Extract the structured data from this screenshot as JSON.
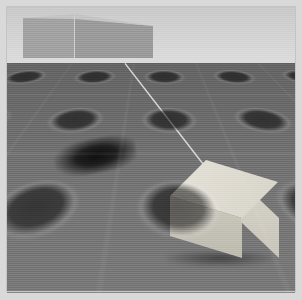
{
  "scene": {
    "title": "3D Rendered Outdoor Scene",
    "description": "Synthetic render of a perspective ground plane with recessed square tiles, a light cuboid object in the foreground, a dark patch on the ground, a distant building on the horizon, and a thin light line descending from the horizon to the foreground box.",
    "render_style": "photorealistic-synthetic",
    "frame": {
      "width_px": 302,
      "height_px": 300,
      "mat_color": "#d9d9d9",
      "mat_border_px": 7
    },
    "camera": {
      "horizon_y_px": 63,
      "view": "low-angle perspective"
    },
    "colors": {
      "sky_top": "#c9c9c9",
      "sky_bottom": "#dcdcdc",
      "ground_near": "#787878",
      "ground_far": "#5f5f5f",
      "building_left_face": "#a2a2a2",
      "building_right_face": "#9a9a9a",
      "building_top_face": "#c4c4c4",
      "box_top_face": "#e0ddd3",
      "box_front_face": "#c4c1b6",
      "box_side_face": "#d0cdc2",
      "dark_patch": "#121212",
      "cable_line": "#d8d8d8"
    },
    "objects": [
      {
        "name": "sky",
        "label": "Sky / background gradient",
        "kind": "backdrop"
      },
      {
        "name": "ground-plane",
        "label": "Tiled ground plane",
        "kind": "surface",
        "pattern": "grid of rounded square recesses",
        "tile_pitch_px": 62
      },
      {
        "name": "distant-building",
        "label": "Distant building",
        "kind": "cuboid",
        "bbox_px": [
          23,
          14,
          130,
          44
        ],
        "faces_visible": 3
      },
      {
        "name": "cable-line",
        "label": "Thin light line",
        "kind": "line",
        "start_px": [
          125,
          63
        ],
        "end_px": [
          218,
          182
        ]
      },
      {
        "name": "dark-patch",
        "label": "Dark patch on ground",
        "kind": "blob",
        "bbox_px": [
          54,
          139,
          82,
          34
        ],
        "rotation_deg": -11
      },
      {
        "name": "foreground-box",
        "label": "Light foreground cuboid",
        "kind": "cuboid",
        "bbox_px": [
          170,
          160,
          120,
          110
        ],
        "faces_visible": 3
      }
    ]
  }
}
